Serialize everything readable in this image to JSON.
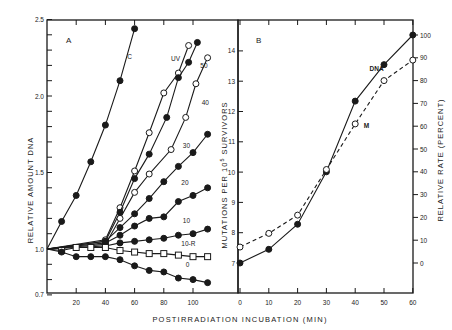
{
  "chart_data": [
    {
      "panel": "A",
      "type": "line",
      "title": "",
      "xlabel": "POSTIRRADIATION INCUBATION (MIN)",
      "ylabel": "RELATIVE AMOUNT DNA",
      "xlim": [
        0,
        115
      ],
      "ylim": [
        0.7,
        2.5
      ],
      "xticks": [
        20,
        40,
        60,
        80,
        100
      ],
      "yticks": [
        0.7,
        1.0,
        1.5,
        2.0,
        2.5
      ],
      "yticks_minor_step": 0.1,
      "grid": false,
      "series": [
        {
          "name": "C",
          "marker": "filled-circle",
          "x": [
            0,
            10,
            20,
            30,
            40,
            50,
            60
          ],
          "y": [
            1.0,
            1.18,
            1.35,
            1.57,
            1.81,
            2.1,
            2.44
          ],
          "label_pos": [
            55,
            2.24
          ]
        },
        {
          "name": "UV",
          "marker": "open-circle",
          "x": [
            0,
            40,
            50,
            60,
            70,
            80,
            90,
            97
          ],
          "y": [
            1.0,
            1.06,
            1.27,
            1.51,
            1.76,
            2.02,
            2.15,
            2.33
          ],
          "label_pos": [
            85,
            2.23
          ]
        },
        {
          "name": "50",
          "marker": "filled-circle",
          "x": [
            0,
            40,
            50,
            60,
            70,
            82,
            90,
            97,
            103
          ],
          "y": [
            1.0,
            1.05,
            1.24,
            1.46,
            1.62,
            1.86,
            2.12,
            2.22,
            2.35
          ],
          "label_pos": [
            105,
            2.18
          ]
        },
        {
          "name": "40",
          "marker": "open-circle",
          "x": [
            0,
            40,
            50,
            60,
            70,
            85,
            95,
            102,
            110
          ],
          "y": [
            1.0,
            1.03,
            1.2,
            1.37,
            1.49,
            1.65,
            1.86,
            2.08,
            2.25
          ],
          "label_pos": [
            106,
            1.94
          ]
        },
        {
          "name": "30",
          "marker": "filled-circle",
          "x": [
            0,
            40,
            50,
            60,
            70,
            80,
            90,
            100,
            110
          ],
          "y": [
            1.0,
            1.05,
            1.14,
            1.23,
            1.33,
            1.44,
            1.54,
            1.63,
            1.75
          ],
          "label_pos": [
            93,
            1.66
          ]
        },
        {
          "name": "20",
          "marker": "filled-circle",
          "x": [
            0,
            40,
            50,
            60,
            70,
            80,
            90,
            100,
            110
          ],
          "y": [
            1.0,
            1.04,
            1.09,
            1.15,
            1.2,
            1.21,
            1.31,
            1.35,
            1.4
          ],
          "label_pos": [
            92,
            1.42
          ]
        },
        {
          "name": "10",
          "marker": "filled-circle",
          "x": [
            0,
            40,
            50,
            60,
            70,
            80,
            90,
            100,
            110
          ],
          "y": [
            1.0,
            1.02,
            1.04,
            1.05,
            1.06,
            1.07,
            1.09,
            1.1,
            1.13
          ],
          "label_pos": [
            93,
            1.17
          ]
        },
        {
          "name": "10-R",
          "marker": "open-square",
          "x": [
            0,
            10,
            20,
            30,
            40,
            50,
            60,
            70,
            80,
            90,
            100,
            110
          ],
          "y": [
            1.0,
            0.99,
            1.01,
            1.01,
            1.01,
            0.99,
            0.98,
            0.97,
            0.97,
            0.96,
            0.95,
            0.95
          ],
          "label_pos": [
            92,
            1.02
          ]
        },
        {
          "name": "0",
          "marker": "filled-circle",
          "x": [
            0,
            10,
            20,
            30,
            40,
            50,
            60,
            70,
            80,
            90,
            100,
            110
          ],
          "y": [
            1.0,
            0.98,
            0.95,
            0.95,
            0.95,
            0.93,
            0.89,
            0.86,
            0.85,
            0.81,
            0.8,
            0.78
          ],
          "label_pos": [
            95,
            0.88
          ]
        }
      ]
    },
    {
      "panel": "B",
      "type": "line",
      "title": "",
      "xlabel": "POSTIRRADIATION INCUBATION (MIN)",
      "ylabel": "MUTATIONS PER 10^5 SURVIVORS",
      "ylabel_right": "RELATIVE RATE (PERCENT)",
      "xlim": [
        0,
        60
      ],
      "ylim": [
        6,
        15
      ],
      "ylim_right": [
        -30,
        125
      ],
      "xticks": [
        0,
        10,
        20,
        30,
        40,
        50,
        60
      ],
      "yticks": [
        7,
        8,
        9,
        10,
        11,
        12,
        13,
        14
      ],
      "yticks_right": [
        0,
        10,
        20,
        30,
        40,
        50,
        60,
        70,
        80,
        90,
        100
      ],
      "grid": false,
      "series": [
        {
          "name": "DNA",
          "marker": "filled-circle",
          "linestyle": "solid",
          "x": [
            0,
            10,
            20,
            30,
            40,
            50,
            60
          ],
          "y_percent": [
            0,
            6,
            17,
            40,
            71,
            87,
            100
          ],
          "label_pos": [
            45,
            85
          ]
        },
        {
          "name": "M",
          "marker": "open-circle",
          "linestyle": "dashed",
          "x": [
            0,
            10,
            20,
            30,
            40,
            50,
            60
          ],
          "y_percent": [
            7,
            13,
            21,
            41,
            61,
            80,
            89
          ],
          "label_pos": [
            43,
            60
          ]
        }
      ]
    }
  ],
  "panelA": {
    "letter": "A",
    "ylabel": "RELATIVE AMOUNT DNA",
    "ytick_labels": [
      "2.5",
      "2.0",
      "1.5",
      "1.0",
      "0.7"
    ],
    "xtick_labels": [
      "20",
      "40",
      "60",
      "80",
      "100"
    ]
  },
  "panelB": {
    "letter": "B",
    "ylabel_left_main": "MUTATIONS PER 10",
    "ylabel_left_sup": "5",
    "ylabel_left_tail": " SURVIVORS",
    "ylabel_right": "RELATIVE RATE (PERCENT)",
    "ytick_labels": [
      "14",
      "13",
      "12",
      "11",
      "10",
      "9",
      "8",
      "7"
    ],
    "ytick_right_labels": [
      "100",
      "90",
      "80",
      "70",
      "60",
      "50",
      "40",
      "30",
      "20",
      "10",
      "0"
    ],
    "xtick_labels": [
      "0",
      "10",
      "20",
      "30",
      "40",
      "50",
      "60"
    ]
  },
  "xlabel": "POSTIRRADIATION INCUBATION (MIN)",
  "colors": {
    "ink": "#1a1a1a",
    "background": "#ffffff"
  }
}
